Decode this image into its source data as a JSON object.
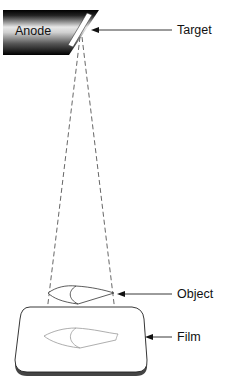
{
  "diagram": {
    "type": "x-ray projection geometry",
    "anode": {
      "label": "Anode"
    },
    "labels": {
      "target": "Target",
      "object": "Object",
      "film": "Film"
    },
    "colors": {
      "line": "#222222",
      "dash": "#555555",
      "film_shadow": "#444444",
      "image_outline": "#999999"
    }
  }
}
